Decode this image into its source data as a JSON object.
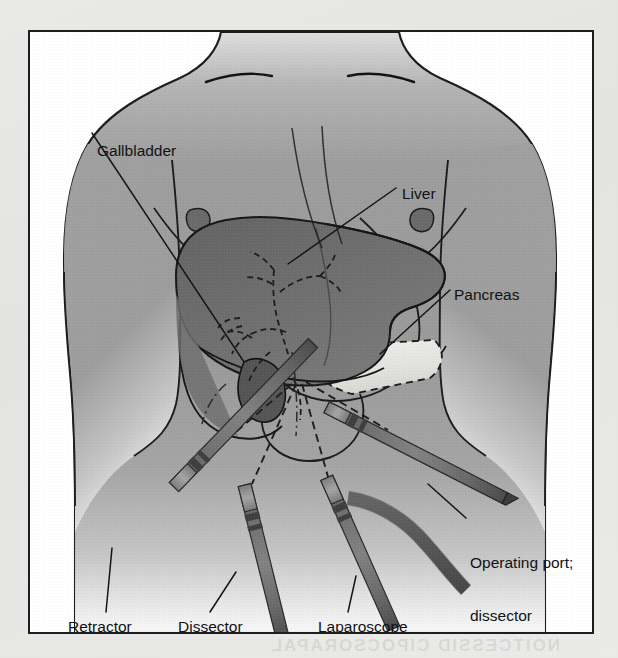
{
  "plate": {
    "title": "Laparoscopic cholecystectomy port placement",
    "frame_color": "#1d1d1d",
    "background_color": "#ffffff",
    "page_background_color": "#e9e9e7"
  },
  "bleed_through_text": "NOITCESSID CIPOCSORAPAL",
  "labels": {
    "gallbladder": "Gallbladder",
    "liver": "Liver",
    "pancreas": "Pancreas",
    "operating_port_line1": "Operating port;",
    "operating_port_line2": "dissector",
    "retractor": "Retractor",
    "dissector": "Dissector",
    "laparoscope": "Laparoscope"
  },
  "anatomy": {
    "torso": {
      "name": "torso",
      "fill": "#9b9b9b"
    },
    "liver": {
      "name": "liver",
      "fill": "#6e6e6e"
    },
    "gallbladder": {
      "name": "gallbladder",
      "fill": "#5b5b5b"
    },
    "pancreas": {
      "name": "pancreas",
      "fill": "#e4e4e1"
    },
    "stomach": {
      "name": "stomach",
      "fill": "none"
    },
    "biliary_tree": {
      "name": "biliary-tree",
      "stroke": "#232323",
      "style": "dashed"
    }
  },
  "instruments": [
    {
      "id": "retractor",
      "label": "Retractor",
      "shaft_color": "#6d6d6d",
      "entry_x": 262,
      "entry_y": 352
    },
    {
      "id": "dissector",
      "label": "Dissector",
      "shaft_color": "#6d6d6d",
      "entry_x": 266,
      "entry_y": 352
    },
    {
      "id": "laparoscope",
      "label": "Laparoscope",
      "shaft_color": "#6d6d6d",
      "entry_x": 272,
      "entry_y": 352
    },
    {
      "id": "operating-port",
      "label": "Operating port; dissector",
      "shaft_color": "#6d6d6d",
      "entry_x": 276,
      "entry_y": 350
    }
  ],
  "colors": {
    "ink": "#111215",
    "leader_line": "#1a1a1a",
    "torso_outline": "#1c1c1c",
    "instrument_dark": "#5d5d5d",
    "instrument_mid": "#757575",
    "instrument_light": "#9d9d9d"
  }
}
